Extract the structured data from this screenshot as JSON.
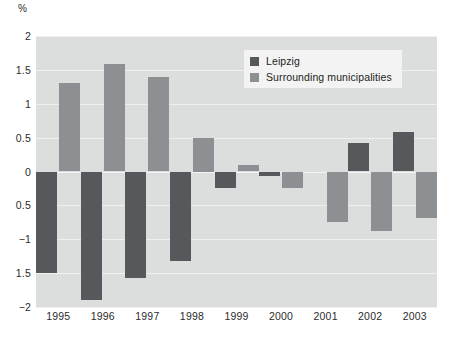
{
  "chart_data": {
    "type": "bar",
    "title": "",
    "subtitle": "",
    "unit_label": "%",
    "xlabel": "",
    "ylabel": "%",
    "categories": [
      "1995",
      "1996",
      "1997",
      "1998",
      "1999",
      "2000",
      "2001",
      "2002",
      "2003"
    ],
    "series": [
      {
        "name": "Leipzig",
        "color": "#56595b",
        "values": [
          -1.5,
          -1.9,
          -1.57,
          -1.32,
          -0.25,
          -0.07,
          0.0,
          0.42,
          0.58
        ]
      },
      {
        "name": "Surrounding municipalities",
        "color": "#8d9093",
        "values": [
          1.3,
          1.58,
          1.4,
          0.5,
          0.1,
          -0.25,
          -0.75,
          -0.88,
          -0.68
        ]
      }
    ],
    "ylim": [
      -2,
      2
    ],
    "yticks": [
      2,
      1.5,
      1,
      0.5,
      0,
      -0.5,
      -1,
      -1.5,
      -2
    ],
    "ytick_labels": [
      "2",
      "1.5",
      "1",
      "0.5",
      "0",
      "0.5",
      "−1",
      "1.5",
      "−2"
    ],
    "grid": true,
    "legend_position": "top-center",
    "plot_background": "#dcdedd",
    "gridline_color": "#eef0ef"
  },
  "legend": {
    "items": [
      {
        "label": "Leipzig",
        "swatch": "leipzig"
      },
      {
        "label": "Surrounding municipalities",
        "swatch": "surrounding"
      }
    ]
  }
}
